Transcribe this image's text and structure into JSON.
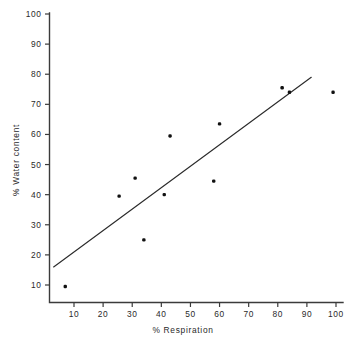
{
  "chart_data": {
    "type": "scatter",
    "title": "",
    "xlabel": "% Respiration",
    "ylabel": "% Water content",
    "xlim": [
      0,
      103
    ],
    "ylim": [
      3,
      103
    ],
    "xticks": [
      10,
      20,
      30,
      40,
      50,
      60,
      70,
      80,
      90,
      100
    ],
    "yticks": [
      10,
      20,
      30,
      40,
      50,
      60,
      70,
      80,
      90,
      100
    ],
    "xtick_labels": [
      "10",
      "20",
      "30",
      "40",
      "50",
      "60",
      "70",
      "80",
      "90",
      "100"
    ],
    "ytick_labels": [
      "10",
      "20",
      "30",
      "40",
      "50",
      "60",
      "70",
      "80",
      "90",
      "100"
    ],
    "grid": false,
    "legend": null,
    "point_color": "#111111",
    "line_color": "#2b2b2b",
    "axis_color": "#3b3b3b",
    "background": "#ffffff",
    "points": [
      {
        "x": 7.0,
        "y": 9.5
      },
      {
        "x": 25.5,
        "y": 39.5
      },
      {
        "x": 31.0,
        "y": 45.5
      },
      {
        "x": 34.0,
        "y": 25.0
      },
      {
        "x": 41.0,
        "y": 40.0
      },
      {
        "x": 43.0,
        "y": 59.5
      },
      {
        "x": 58.0,
        "y": 44.5
      },
      {
        "x": 60.0,
        "y": 63.5
      },
      {
        "x": 81.5,
        "y": 75.5
      },
      {
        "x": 84.0,
        "y": 74.0
      },
      {
        "x": 99.0,
        "y": 74.0
      }
    ],
    "trend_line": {
      "type": "linear-fit",
      "x_start": 3.0,
      "y_start": 16.0,
      "x_end": 91.5,
      "y_end": 79.0
    }
  }
}
